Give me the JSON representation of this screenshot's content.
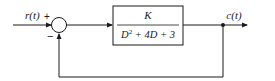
{
  "diagram": {
    "type": "feedback-control-block-diagram",
    "input": {
      "label": "r(t)"
    },
    "summing_junction": {
      "plus_sign": "+",
      "minus_sign": "−"
    },
    "block": {
      "numerator": "K",
      "denominator_parts": {
        "d": "D",
        "exp": "2",
        "rest": " + 4D + 3"
      }
    },
    "output": {
      "label": "c(t)"
    },
    "feedback": {
      "type": "unity",
      "sign": "negative"
    }
  }
}
